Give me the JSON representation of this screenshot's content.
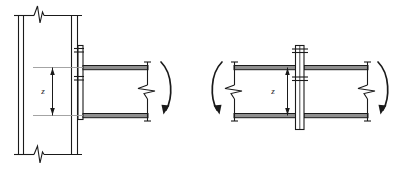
{
  "figure": {
    "type": "engineering-drawing",
    "background_color": "#ffffff",
    "line_color": "#1a1a1a",
    "hatch_color": "#808080",
    "width": 413,
    "height": 170
  },
  "details": [
    {
      "id": "left",
      "name": "beam-to-column-flange-connection",
      "dimension_label": "z",
      "dimension_label_x": 44,
      "dimension_label_y": 91,
      "column": {
        "name": "column-section",
        "x_left": 17,
        "x_right": 78,
        "y_top": 14,
        "y_bottom": 156,
        "web_lines_x": [
          22,
          26,
          71,
          75
        ],
        "break_top_y": 14,
        "break_bottom_y": 156
      },
      "end_plate": {
        "name": "end-plate",
        "x": 78,
        "y_top": 45,
        "y_bottom": 120,
        "thickness": 5
      },
      "bolts": [
        {
          "name": "bolt-upper",
          "y": 48
        },
        {
          "name": "bolt-lower",
          "y": 79
        }
      ],
      "beam": {
        "name": "beam-section",
        "x_start": 83,
        "x_end": 148,
        "top_flange_y": 68,
        "bottom_flange_y": 116,
        "flange_thickness": 4,
        "break_symbol_x": 142,
        "break_symbol_y": 92
      },
      "dimension": {
        "name": "lever-arm-z",
        "x": 52,
        "y_top": 68,
        "y_bottom": 116,
        "extension_left": 32,
        "extension_right": 83
      },
      "moment_arrow": {
        "name": "moment-rotation-arrow-right",
        "direction": "clockwise",
        "cx": 168,
        "cy_top": 62,
        "cy_bottom": 112
      }
    },
    {
      "id": "right",
      "name": "beam-to-beam-splice-connection",
      "dimension_label": "z",
      "dimension_label_x": 272,
      "dimension_label_y": 91,
      "splice_plate": {
        "name": "splice-plate",
        "x": 296,
        "y_top": 45,
        "y_bottom": 130,
        "thickness": 8
      },
      "bolts": [
        {
          "name": "bolt-upper",
          "y": 49
        },
        {
          "name": "bolt-lower",
          "y": 80
        }
      ],
      "beam_left": {
        "name": "beam-left-section",
        "x_start": 233,
        "x_end": 296,
        "top_flange_y": 68,
        "bottom_flange_y": 116,
        "break_symbol_x": 239,
        "break_symbol_y": 92
      },
      "beam_right": {
        "name": "beam-right-section",
        "x_start": 304,
        "x_end": 368,
        "top_flange_y": 68,
        "bottom_flange_y": 116,
        "break_symbol_x": 362,
        "break_symbol_y": 92
      },
      "dimension": {
        "name": "lever-arm-z",
        "x": 287,
        "y_top": 68,
        "y_bottom": 116
      },
      "moment_arrow_left": {
        "name": "moment-rotation-arrow-left",
        "direction": "counter-clockwise",
        "cx": 216
      },
      "moment_arrow_right": {
        "name": "moment-rotation-arrow-right",
        "direction": "clockwise",
        "cx": 385
      }
    }
  ]
}
